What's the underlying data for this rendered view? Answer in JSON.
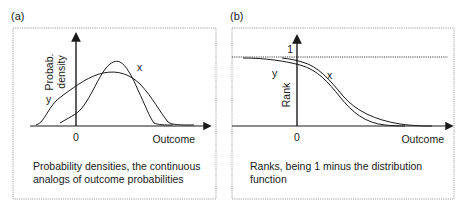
{
  "panels": [
    {
      "id": "a",
      "tag": "(a)",
      "ylabel_line1": "Probab.",
      "ylabel_line2": "density",
      "xlabel": "Outcome",
      "origin_label": "0",
      "curve_labels": {
        "x": "x",
        "y": "y"
      },
      "caption_line1": "Probability densities, the continuous",
      "caption_line2": "analogs of outcome probabilities"
    },
    {
      "id": "b",
      "tag": "(b)",
      "ylabel": "Rank",
      "xlabel": "Outcome",
      "origin_label": "0",
      "top_tick_label": "1",
      "curve_labels": {
        "x": "x",
        "y": "y"
      },
      "caption_line1": "Ranks, being 1 minus the distribution",
      "caption_line2": "function"
    }
  ],
  "colors": {
    "ink": "#1a1a1a",
    "border": "#8a8a8a",
    "background": "#ffffff"
  }
}
